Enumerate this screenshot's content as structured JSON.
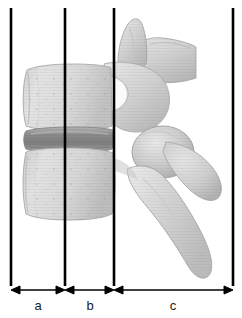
{
  "figure": {
    "kind": "anatomical-diagram",
    "background_color": "#ffffff",
    "width": 242,
    "height": 318
  },
  "reference_lines": [
    {
      "id": "line-1",
      "name": "anterior-margin-line",
      "x": 11,
      "y_top": 8,
      "y_bottom": 286,
      "color": "#000000",
      "width": 2.6
    },
    {
      "id": "line-2",
      "name": "mid-body-line",
      "x": 65,
      "y_top": 8,
      "y_bottom": 286,
      "color": "#000000",
      "width": 2.6
    },
    {
      "id": "line-3",
      "name": "posterior-body-line",
      "x": 114,
      "y_top": 8,
      "y_bottom": 286,
      "color": "#000000",
      "width": 2.6
    },
    {
      "id": "line-4",
      "name": "posterior-margin-line",
      "x": 233,
      "y_top": 8,
      "y_bottom": 286,
      "color": "#000000",
      "width": 2.6
    }
  ],
  "scale_bar": {
    "name": "dimension-scale",
    "y": 290,
    "color": "#000000",
    "segments": [
      {
        "id": "a",
        "label": "a",
        "x_start": 11,
        "x_end": 65,
        "label_x": 38,
        "label_y": 298
      },
      {
        "id": "b",
        "label": "b",
        "x_start": 65,
        "x_end": 114,
        "label_x": 90,
        "label_y": 298
      },
      {
        "id": "c",
        "label": "c",
        "x_start": 114,
        "x_end": 233,
        "label_x": 173,
        "label_y": 298
      }
    ]
  },
  "anatomy": {
    "colors": {
      "bone_light": "#dcdcdc",
      "bone_mid": "#c9c9c9",
      "bone_shadow": "#b0b0b0",
      "bone_edge": "#9a9a9a",
      "disc_dark": "#8f8f8f",
      "disc_mid": "#a6a6a6",
      "outline": "#8a8a8a"
    },
    "parts": [
      {
        "name": "superior-vertebral-body",
        "description": "upper vertebral body block"
      },
      {
        "name": "intervertebral-disc",
        "description": "dark horizontal disc band between bodies"
      },
      {
        "name": "inferior-vertebral-body",
        "description": "lower vertebral body block"
      },
      {
        "name": "superior-articular-process",
        "description": "upward pointing process, top"
      },
      {
        "name": "transverse-process",
        "description": "wing projecting posteriorly at top right"
      },
      {
        "name": "pedicle",
        "description": "bridge connecting body to posterior arch"
      },
      {
        "name": "vertebral-foramen",
        "description": "light opening behind the body"
      },
      {
        "name": "inferior-articular-process",
        "description": "rounded facet knob, mid right"
      },
      {
        "name": "lower-transverse-process",
        "description": "lower posterior wing"
      },
      {
        "name": "spinous-process",
        "description": "long process angling down and back"
      }
    ]
  }
}
